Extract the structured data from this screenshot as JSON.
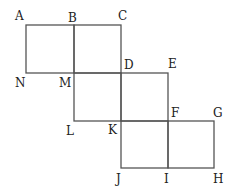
{
  "labels": {
    "A": "A",
    "B": "B",
    "C": "C",
    "N": "N",
    "M": "M",
    "D": "D",
    "E": "E",
    "L": "L",
    "K": "K",
    "F": "F",
    "G": "G",
    "J": "J",
    "I": "I",
    "H": "H"
  },
  "squares": [
    [
      "A",
      "B",
      "M",
      "N"
    ],
    [
      "B",
      "C",
      "D",
      "M"
    ],
    [
      "M",
      "D",
      "K",
      "L"
    ],
    [
      "D",
      "E",
      "F",
      "K"
    ],
    [
      "K",
      "F",
      "I",
      "J"
    ],
    [
      "F",
      "G",
      "H",
      "I"
    ]
  ]
}
